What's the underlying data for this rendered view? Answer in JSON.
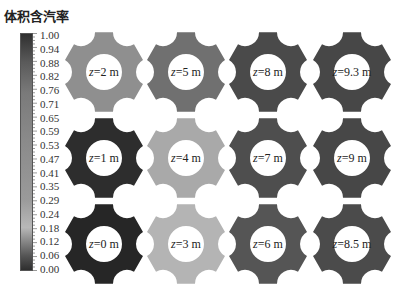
{
  "title": "体积含汽率",
  "colorbar": {
    "ticks": [
      "1.00",
      "0.94",
      "0.88",
      "0.82",
      "0.76",
      "0.71",
      "0.65",
      "0.59",
      "0.53",
      "0.47",
      "0.41",
      "0.35",
      "0.29",
      "0.24",
      "0.18",
      "0.12",
      "0.06",
      "0.00"
    ],
    "min": 0.0,
    "max": 1.0,
    "gradient_stops": [
      {
        "pos": 0.0,
        "color": "#2e2e2e"
      },
      {
        "pos": 0.06,
        "color": "#555555"
      },
      {
        "pos": 0.18,
        "color": "#b8b8b8"
      },
      {
        "pos": 0.3,
        "color": "#9a9a9a"
      },
      {
        "pos": 0.55,
        "color": "#8a8a8a"
      },
      {
        "pos": 0.75,
        "color": "#7a7a7a"
      },
      {
        "pos": 0.88,
        "color": "#5a5a5a"
      },
      {
        "pos": 1.0,
        "color": "#303030"
      }
    ]
  },
  "gears": [
    {
      "label": "z=2 m",
      "z": "2",
      "row": 0,
      "col": 0,
      "color": "#8f8f8f"
    },
    {
      "label": "z=5 m",
      "z": "5",
      "row": 0,
      "col": 1,
      "color": "#707070"
    },
    {
      "label": "z=8 m",
      "z": "8",
      "row": 0,
      "col": 2,
      "color": "#4a4a4a"
    },
    {
      "label": "z=9.3 m",
      "z": "9.3",
      "row": 0,
      "col": 3,
      "color": "#474747"
    },
    {
      "label": "z=1 m",
      "z": "1",
      "row": 1,
      "col": 0,
      "color": "#2d2d2d"
    },
    {
      "label": "z=4 m",
      "z": "4",
      "row": 1,
      "col": 1,
      "color": "#a9a9a9"
    },
    {
      "label": "z=7 m",
      "z": "7",
      "row": 1,
      "col": 2,
      "color": "#4e4e4e"
    },
    {
      "label": "z=9 m",
      "z": "9",
      "row": 1,
      "col": 3,
      "color": "#474747"
    },
    {
      "label": "z=0 m",
      "z": "0",
      "row": 2,
      "col": 0,
      "color": "#262626"
    },
    {
      "label": "z=3 m",
      "z": "3",
      "row": 2,
      "col": 1,
      "color": "#b4b4b4"
    },
    {
      "label": "z=6 m",
      "z": "6",
      "row": 2,
      "col": 2,
      "color": "#555555"
    },
    {
      "label": "z=8.5 m",
      "z": "8.5",
      "row": 2,
      "col": 3,
      "color": "#4b4b4b"
    }
  ]
}
